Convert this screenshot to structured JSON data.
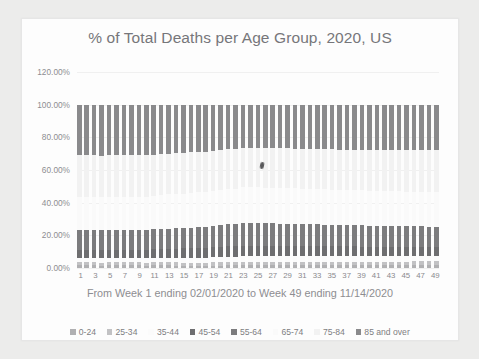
{
  "chart_data": {
    "type": "bar",
    "subtype": "100% stacked column",
    "title": "% of Total Deaths per Age Group, 2020, US",
    "xlabel": "From Week 1 ending 02/01/2020 to Week 49 ending 11/14/2020",
    "ylabel": "",
    "ylim": [
      0,
      120
    ],
    "ytick_labels": [
      "0.00%",
      "20.00%",
      "40.00%",
      "60.00%",
      "80.00%",
      "100.00%",
      "120.00%"
    ],
    "ytick_values": [
      0,
      20,
      40,
      60,
      80,
      100,
      120
    ],
    "grid": true,
    "legend_position": "bottom",
    "categories": [
      1,
      2,
      3,
      4,
      5,
      6,
      7,
      8,
      9,
      10,
      11,
      12,
      13,
      14,
      15,
      16,
      17,
      18,
      19,
      20,
      21,
      22,
      23,
      24,
      25,
      26,
      27,
      28,
      29,
      30,
      31,
      32,
      33,
      34,
      35,
      36,
      37,
      38,
      39,
      40,
      41,
      42,
      43,
      44,
      45,
      46,
      47,
      48,
      49
    ],
    "xtick_labels": [
      "1",
      "3",
      "5",
      "7",
      "9",
      "11",
      "13",
      "15",
      "17",
      "19",
      "21",
      "23",
      "25",
      "27",
      "29",
      "31",
      "33",
      "35",
      "37",
      "39",
      "41",
      "43",
      "45",
      "47",
      "49"
    ],
    "series": [
      {
        "name": "0-24",
        "color": "#b0b0b2",
        "values": [
          1.6,
          1.6,
          1.6,
          1.5,
          1.6,
          1.6,
          1.6,
          1.6,
          1.6,
          1.5,
          1.6,
          1.6,
          1.6,
          1.5,
          1.4,
          1.4,
          1.4,
          1.4,
          1.5,
          1.5,
          1.6,
          1.6,
          1.7,
          1.7,
          1.7,
          1.7,
          1.7,
          1.7,
          1.7,
          1.7,
          1.7,
          1.7,
          1.7,
          1.7,
          1.7,
          1.7,
          1.7,
          1.7,
          1.7,
          1.7,
          1.7,
          1.7,
          1.7,
          1.7,
          1.7,
          1.8,
          1.8,
          1.8,
          1.8
        ]
      },
      {
        "name": "25-34",
        "color": "#c2c2c4",
        "values": [
          1.8,
          1.8,
          1.8,
          1.8,
          1.8,
          1.8,
          1.8,
          1.8,
          1.8,
          1.8,
          1.8,
          1.9,
          1.9,
          1.9,
          1.9,
          1.9,
          1.9,
          1.9,
          2.0,
          2.0,
          2.1,
          2.1,
          2.2,
          2.2,
          2.2,
          2.2,
          2.2,
          2.2,
          2.2,
          2.2,
          2.2,
          2.2,
          2.2,
          2.2,
          2.2,
          2.2,
          2.2,
          2.2,
          2.2,
          2.2,
          2.2,
          2.2,
          2.2,
          2.2,
          2.2,
          2.2,
          2.2,
          2.2,
          2.2
        ]
      },
      {
        "name": "35-44",
        "color": "#fbfbfb",
        "values": [
          2.6,
          2.6,
          2.6,
          2.6,
          2.6,
          2.6,
          2.6,
          2.6,
          2.6,
          2.6,
          2.7,
          2.7,
          2.8,
          2.8,
          2.9,
          2.9,
          3.0,
          3.0,
          3.1,
          3.1,
          3.2,
          3.2,
          3.3,
          3.3,
          3.3,
          3.3,
          3.3,
          3.3,
          3.3,
          3.3,
          3.3,
          3.3,
          3.2,
          3.2,
          3.2,
          3.2,
          3.2,
          3.2,
          3.2,
          3.2,
          3.2,
          3.2,
          3.2,
          3.2,
          3.2,
          3.2,
          3.2,
          3.2,
          3.2
        ]
      },
      {
        "name": "45-54",
        "color": "#6e6e70",
        "values": [
          5.3,
          5.3,
          5.3,
          5.3,
          5.3,
          5.3,
          5.3,
          5.3,
          5.3,
          5.3,
          5.4,
          5.5,
          5.6,
          5.7,
          5.8,
          5.9,
          6.0,
          6.1,
          6.2,
          6.3,
          6.4,
          6.5,
          6.6,
          6.6,
          6.6,
          6.6,
          6.6,
          6.5,
          6.5,
          6.5,
          6.4,
          6.4,
          6.3,
          6.3,
          6.2,
          6.2,
          6.1,
          6.1,
          6.0,
          6.0,
          5.9,
          5.9,
          5.8,
          5.8,
          5.8,
          5.8,
          5.7,
          5.7,
          5.7
        ]
      },
      {
        "name": "55-64",
        "color": "#7c7c7e",
        "values": [
          12.0,
          12.0,
          12.0,
          12.0,
          12.0,
          12.0,
          12.0,
          12.0,
          12.0,
          12.0,
          12.1,
          12.2,
          12.3,
          12.4,
          12.5,
          12.6,
          12.7,
          12.8,
          13.0,
          13.2,
          13.4,
          13.5,
          13.7,
          13.7,
          13.7,
          13.6,
          13.6,
          13.5,
          13.5,
          13.4,
          13.4,
          13.3,
          13.3,
          13.2,
          13.2,
          13.1,
          13.1,
          13.0,
          13.0,
          12.9,
          12.9,
          12.8,
          12.8,
          12.7,
          12.7,
          12.6,
          12.6,
          12.5,
          12.5
        ]
      },
      {
        "name": "65-74",
        "color": "#fafafa",
        "values": [
          20.5,
          20.5,
          20.5,
          20.5,
          20.5,
          20.5,
          20.5,
          20.5,
          20.5,
          20.6,
          20.7,
          20.8,
          20.9,
          21.0,
          21.1,
          21.2,
          21.3,
          21.4,
          21.5,
          21.6,
          21.7,
          21.8,
          21.9,
          21.9,
          21.9,
          21.9,
          21.8,
          21.8,
          21.8,
          21.7,
          21.7,
          21.7,
          21.6,
          21.6,
          21.6,
          21.5,
          21.5,
          21.5,
          21.4,
          21.4,
          21.4,
          21.3,
          21.3,
          21.3,
          21.2,
          21.2,
          21.2,
          21.1,
          21.1
        ]
      },
      {
        "name": "75-84",
        "color": "#f2f2f2",
        "values": [
          25.2,
          25.2,
          25.2,
          25.2,
          25.2,
          25.2,
          25.2,
          25.2,
          25.2,
          25.2,
          25.1,
          25.1,
          25.0,
          25.0,
          24.9,
          24.9,
          24.8,
          24.7,
          24.6,
          24.5,
          24.4,
          24.3,
          24.2,
          24.2,
          24.2,
          24.2,
          24.3,
          24.3,
          24.4,
          24.4,
          24.5,
          24.5,
          24.6,
          24.6,
          24.7,
          24.7,
          24.8,
          24.9,
          24.9,
          25.0,
          25.0,
          25.1,
          25.2,
          25.3,
          25.4,
          25.5,
          25.6,
          25.7,
          25.8
        ]
      },
      {
        "name": "85 and over",
        "color": "#8a8a8c",
        "values": [
          31.0,
          31.0,
          31.0,
          31.1,
          31.0,
          31.0,
          31.0,
          31.0,
          31.0,
          31.0,
          30.6,
          30.2,
          29.9,
          29.7,
          29.4,
          29.2,
          28.9,
          28.7,
          28.1,
          27.8,
          27.2,
          27.0,
          26.4,
          26.4,
          26.4,
          26.5,
          26.5,
          26.7,
          26.6,
          26.8,
          26.8,
          26.9,
          27.1,
          27.2,
          27.2,
          27.4,
          27.4,
          27.4,
          27.6,
          27.6,
          27.7,
          27.8,
          27.8,
          27.8,
          27.8,
          27.7,
          27.7,
          27.8,
          27.7
        ]
      }
    ]
  },
  "legend": {
    "items": [
      {
        "label": "0-24"
      },
      {
        "label": "25-34"
      },
      {
        "label": "35-44"
      },
      {
        "label": "45-54"
      },
      {
        "label": "55-64"
      },
      {
        "label": "65-74"
      },
      {
        "label": "75-84"
      },
      {
        "label": "85 and over"
      }
    ]
  }
}
